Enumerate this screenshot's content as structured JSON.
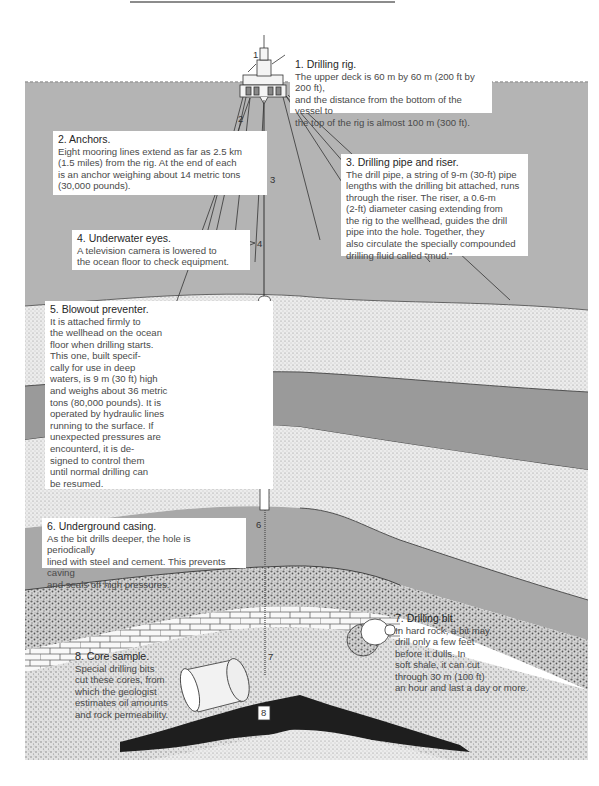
{
  "diagram": {
    "colors": {
      "sea": "#b4b4b4",
      "shale_dark": "#9a9a9a",
      "shale_mid": "#a8a8a8",
      "sand_light": "#e4e4e4",
      "gravel": "#cfcfcf",
      "oil_reservoir": "#1e1e1e",
      "label_bg": "#ffffff"
    },
    "markers": [
      "1",
      "2",
      "3",
      "4",
      "5",
      "6",
      "7",
      "8"
    ],
    "callouts": [
      {
        "id": 1,
        "title": "1. Drilling rig.",
        "body": "The upper deck is 60 m by 60 m (200 ft by 200 ft),\nand the distance from the bottom of the vessel to\nthe top of the rig is almost 100 m (300 ft)."
      },
      {
        "id": 2,
        "title": "2. Anchors.",
        "body": "Eight mooring lines extend as far as 2.5 km\n(1.5 miles) from the rig. At the end of each\nis an anchor weighing about 14 metric tons\n(30,000 pounds)."
      },
      {
        "id": 3,
        "title": "3. Drilling pipe and riser.",
        "body": "The drill pipe, a string of 9-m (30-ft) pipe\nlengths with the drilling bit attached, runs\nthrough the riser. The riser, a 0.6-m\n(2-ft) diameter casing extending from\nthe rig to the wellhead, guides the drill\npipe into the hole. Together, they\nalso circulate the specially compounded\ndrilling fluid called “mud.”"
      },
      {
        "id": 4,
        "title": "4. Underwater eyes.",
        "body": "A television camera is lowered to\nthe ocean floor to check equipment."
      },
      {
        "id": 5,
        "title": "5. Blowout preventer.",
        "body": "It is attached firmly to\nthe wellhead on the ocean\nfloor when drilling starts.\nThis one, built specif-\ncally for use in deep\nwaters, is 9 m (30 ft) high\nand weighs about 36 metric\ntons (80,000 pounds). It is\noperated by hydraulic lines\nrunning to the surface. If\nunexpected pressures are\nencounterd, it is de-\nsigned to control them\nuntil normal drilling can\nbe resumed."
      },
      {
        "id": 6,
        "title": "6. Underground casing.",
        "body": "As the bit drills deeper, the hole is periodically\nlined with steel and cement. This prevents caving\nand seals off high pressures."
      },
      {
        "id": 7,
        "title": "7. Drilling bit.",
        "body": "In hard rock, a bit may\ndrill only a few feet\nbefore it dulls. In\nsoft shale, it can cut\nthrough 30 m (100 ft)\nan hour and last a day or more."
      },
      {
        "id": 8,
        "title": "8. Core sample.",
        "body": "Special drilling bits\ncut these cores, from\nwhich the geologist\nestimates oil amounts\nand rock permeability."
      }
    ]
  }
}
